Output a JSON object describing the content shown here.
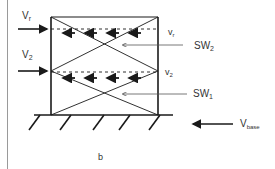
{
  "diagram": {
    "caption": "b",
    "loads": {
      "roof": {
        "main": "V",
        "sub": "r"
      },
      "second": {
        "main": "V",
        "sub": "2"
      }
    },
    "story_shears": {
      "roof": {
        "main": "v",
        "sub": "r"
      },
      "second": {
        "main": "v",
        "sub": "2"
      }
    },
    "shear_walls": {
      "upper": {
        "main": "SW",
        "sub": "2"
      },
      "lower": {
        "main": "SW",
        "sub": "1"
      }
    },
    "base_shear": {
      "main": "V",
      "sub": "base"
    },
    "colors": {
      "line": "#1a1a1a",
      "text": "#333333",
      "rule": "#9a9a9a"
    }
  }
}
